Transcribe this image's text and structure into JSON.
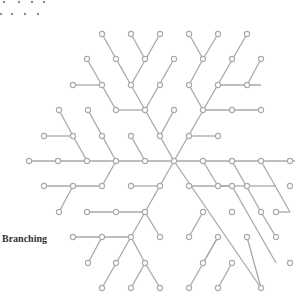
{
  "label": "Branching",
  "colors": {
    "line": "#a9a9a9",
    "node_fill": "#ffffff",
    "dots": "#8c8c8c"
  },
  "top_dots": [
    [
      4,
      2
    ],
    [
      19,
      2
    ],
    [
      32,
      2
    ],
    [
      44,
      2
    ],
    [
      1,
      14
    ],
    [
      12,
      14
    ],
    [
      25,
      14
    ],
    [
      38,
      14
    ]
  ],
  "nodes": [
    [
      174,
      161
    ],
    [
      145,
      161
    ],
    [
      116,
      161
    ],
    [
      87,
      161
    ],
    [
      58,
      161
    ],
    [
      29,
      161
    ],
    [
      131,
      136
    ],
    [
      102,
      136
    ],
    [
      88,
      110
    ],
    [
      73,
      136
    ],
    [
      44,
      136
    ],
    [
      59,
      110
    ],
    [
      102,
      186
    ],
    [
      73,
      186
    ],
    [
      44,
      186
    ],
    [
      59,
      212
    ],
    [
      160,
      136
    ],
    [
      145,
      110
    ],
    [
      131,
      85
    ],
    [
      116,
      59
    ],
    [
      102,
      34
    ],
    [
      174,
      110
    ],
    [
      116,
      110
    ],
    [
      102,
      85
    ],
    [
      73,
      85
    ],
    [
      87,
      59
    ],
    [
      145,
      59
    ],
    [
      160,
      34
    ],
    [
      131,
      34
    ],
    [
      160,
      85
    ],
    [
      174,
      59
    ],
    [
      189,
      136
    ],
    [
      203,
      110
    ],
    [
      218,
      85
    ],
    [
      232,
      59
    ],
    [
      247,
      34
    ],
    [
      218,
      136
    ],
    [
      232,
      110
    ],
    [
      261,
      110
    ],
    [
      247,
      85
    ],
    [
      261,
      59
    ],
    [
      189,
      85
    ],
    [
      203,
      59
    ],
    [
      189,
      34
    ],
    [
      218,
      34
    ],
    [
      203,
      161
    ],
    [
      232,
      161
    ],
    [
      261,
      161
    ],
    [
      290,
      161
    ],
    [
      218,
      186
    ],
    [
      247,
      186
    ],
    [
      232,
      212
    ],
    [
      261,
      212
    ],
    [
      247,
      237
    ],
    [
      276,
      237
    ],
    [
      160,
      186
    ],
    [
      131,
      186
    ],
    [
      145,
      212
    ],
    [
      116,
      212
    ],
    [
      87,
      212
    ],
    [
      160,
      237
    ],
    [
      131,
      237
    ],
    [
      102,
      237
    ],
    [
      73,
      237
    ],
    [
      88,
      263
    ],
    [
      116,
      263
    ],
    [
      102,
      288
    ],
    [
      145,
      263
    ],
    [
      131,
      288
    ],
    [
      160,
      288
    ],
    [
      189,
      186
    ],
    [
      203,
      212
    ],
    [
      232,
      186
    ],
    [
      218,
      237
    ],
    [
      189,
      237
    ],
    [
      232,
      263
    ],
    [
      203,
      263
    ],
    [
      218,
      288
    ],
    [
      189,
      288
    ],
    [
      261,
      288
    ],
    [
      290,
      186
    ],
    [
      276,
      212
    ],
    [
      290,
      263
    ]
  ],
  "edges": [
    [
      174,
      161,
      29,
      161
    ],
    [
      145,
      161,
      131,
      136
    ],
    [
      116,
      161,
      88,
      110
    ],
    [
      87,
      161,
      73,
      136
    ],
    [
      73,
      136,
      44,
      136
    ],
    [
      73,
      136,
      59,
      110
    ],
    [
      116,
      161,
      102,
      186
    ],
    [
      102,
      186,
      44,
      186
    ],
    [
      73,
      186,
      59,
      212
    ],
    [
      174,
      161,
      102,
      34
    ],
    [
      160,
      136,
      174,
      110
    ],
    [
      145,
      110,
      116,
      110
    ],
    [
      116,
      110,
      87,
      59
    ],
    [
      102,
      85,
      73,
      85
    ],
    [
      131,
      85,
      160,
      34
    ],
    [
      145,
      59,
      131,
      34
    ],
    [
      145,
      110,
      174,
      59
    ],
    [
      174,
      161,
      247,
      34
    ],
    [
      189,
      136,
      218,
      136
    ],
    [
      203,
      110,
      261,
      110
    ],
    [
      218,
      85,
      261,
      85
    ],
    [
      247,
      85,
      261,
      59
    ],
    [
      203,
      110,
      189,
      85
    ],
    [
      189,
      85,
      203,
      59
    ],
    [
      203,
      59,
      189,
      34
    ],
    [
      203,
      59,
      218,
      34
    ],
    [
      174,
      161,
      295,
      161
    ],
    [
      203,
      161,
      218,
      186
    ],
    [
      218,
      186,
      247,
      186
    ],
    [
      232,
      161,
      261,
      212
    ],
    [
      247,
      186,
      276,
      186
    ],
    [
      261,
      212,
      276,
      237
    ],
    [
      174,
      161,
      102,
      288
    ],
    [
      160,
      186,
      131,
      186
    ],
    [
      145,
      212,
      87,
      212
    ],
    [
      145,
      212,
      160,
      237
    ],
    [
      131,
      237,
      73,
      237
    ],
    [
      102,
      237,
      88,
      263
    ],
    [
      145,
      263,
      131,
      288
    ],
    [
      145,
      263,
      160,
      288
    ],
    [
      131,
      237,
      145,
      263
    ],
    [
      174,
      161,
      261,
      288
    ],
    [
      189,
      186,
      232,
      186
    ],
    [
      232,
      186,
      276,
      263
    ],
    [
      203,
      212,
      189,
      237
    ],
    [
      218,
      237,
      203,
      263
    ],
    [
      232,
      263,
      218,
      288
    ],
    [
      218,
      237,
      189,
      288
    ],
    [
      247,
      237,
      261,
      288
    ],
    [
      261,
      161,
      290,
      212
    ],
    [
      276,
      212,
      290,
      212
    ]
  ]
}
